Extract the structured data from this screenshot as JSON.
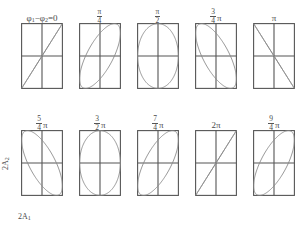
{
  "figure": {
    "title_label": "φ₁−φ₂=0",
    "axis_labels": {
      "x": "2A₁",
      "y": "2A₂"
    },
    "panel_geometry": {
      "box_width": 42,
      "box_height": 66,
      "crosshair": true
    },
    "panels": [
      {
        "label_type": "equation",
        "label_text": "φ₁−φ₂=0",
        "phase_deg": 0,
        "curve": "line",
        "curve_desc": "straight diagonal line, positive slope, from bottom-left corner to top-right corner"
      },
      {
        "label_type": "fraction",
        "numerator": "π",
        "denominator": "4",
        "suffix": "",
        "label_text": "π/4",
        "phase_deg": 45,
        "curve": "ellipse",
        "curve_desc": "narrow tilted ellipse, major axis positive slope"
      },
      {
        "label_type": "fraction",
        "numerator": "π",
        "denominator": "2",
        "suffix": "",
        "label_text": "π/2",
        "phase_deg": 90,
        "curve": "ellipse",
        "curve_desc": "upright ellipse inscribed in box"
      },
      {
        "label_type": "fraction",
        "numerator": "3",
        "denominator": "4",
        "suffix": "π",
        "label_text": "3π/4",
        "phase_deg": 135,
        "curve": "ellipse",
        "curve_desc": "narrow tilted ellipse, major axis negative slope"
      },
      {
        "label_type": "plain",
        "label_text": "π",
        "phase_deg": 180,
        "curve": "line",
        "curve_desc": "straight anti-diagonal line, negative slope, from top-left corner to bottom-right corner"
      },
      {
        "label_type": "fraction",
        "numerator": "5",
        "denominator": "4",
        "suffix": "π",
        "label_text": "5π/4",
        "phase_deg": 225,
        "curve": "ellipse",
        "curve_desc": "narrow tilted ellipse, major axis negative slope"
      },
      {
        "label_type": "fraction",
        "numerator": "3",
        "denominator": "2",
        "suffix": "π",
        "label_text": "3π/2",
        "phase_deg": 270,
        "curve": "ellipse",
        "curve_desc": "upright ellipse inscribed in box"
      },
      {
        "label_type": "fraction",
        "numerator": "7",
        "denominator": "4",
        "suffix": "π",
        "label_text": "7π/4",
        "phase_deg": 315,
        "curve": "ellipse",
        "curve_desc": "narrow tilted ellipse, major axis positive slope"
      },
      {
        "label_type": "plain",
        "label_text": "2π",
        "phase_deg": 360,
        "curve": "line",
        "curve_desc": "straight diagonal line, positive slope, from bottom-left corner to top-right corner"
      },
      {
        "label_type": "fraction",
        "numerator": "9",
        "denominator": "4",
        "suffix": "π",
        "label_text": "9π/4",
        "phase_deg": 405,
        "curve": "ellipse",
        "curve_desc": "narrow tilted ellipse, major axis positive slope"
      }
    ],
    "colors": {
      "box_stroke": "#555555",
      "curve_stroke": "#8a8a8a",
      "text": "#4a4a4a",
      "background": "#ffffff"
    }
  },
  "chart_data": {
    "type": "line",
    "xlabel": "2A₁",
    "ylabel": "2A₂",
    "xlim": [
      -1,
      1
    ],
    "ylim": [
      -1,
      1
    ],
    "grid": false,
    "legend": null,
    "parametric": "x = A₁·cos(ωt),  y = A₂·cos(ωt + (φ₁−φ₂))",
    "categories": [
      "0",
      "π/4",
      "π/2",
      "3π/4",
      "π",
      "5π/4",
      "3π/2",
      "7π/4",
      "2π",
      "9π/4"
    ],
    "series": [
      {
        "name": "φ₁−φ₂=0",
        "phase_deg": 0,
        "shape": "line",
        "tilt": "positive",
        "eccentricity": 1.0
      },
      {
        "name": "π/4",
        "phase_deg": 45,
        "shape": "ellipse",
        "tilt": "positive",
        "eccentricity": 0.92
      },
      {
        "name": "π/2",
        "phase_deg": 90,
        "shape": "ellipse",
        "tilt": "upright",
        "eccentricity": 0.0
      },
      {
        "name": "3π/4",
        "phase_deg": 135,
        "shape": "ellipse",
        "tilt": "negative",
        "eccentricity": 0.92
      },
      {
        "name": "π",
        "phase_deg": 180,
        "shape": "line",
        "tilt": "negative",
        "eccentricity": 1.0
      },
      {
        "name": "5π/4",
        "phase_deg": 225,
        "shape": "ellipse",
        "tilt": "negative",
        "eccentricity": 0.92
      },
      {
        "name": "3π/2",
        "phase_deg": 270,
        "shape": "ellipse",
        "tilt": "upright",
        "eccentricity": 0.0
      },
      {
        "name": "7π/4",
        "phase_deg": 315,
        "shape": "ellipse",
        "tilt": "positive",
        "eccentricity": 0.92
      },
      {
        "name": "2π",
        "phase_deg": 360,
        "shape": "line",
        "tilt": "positive",
        "eccentricity": 1.0
      },
      {
        "name": "9π/4",
        "phase_deg": 405,
        "shape": "ellipse",
        "tilt": "positive",
        "eccentricity": 0.92
      }
    ]
  }
}
